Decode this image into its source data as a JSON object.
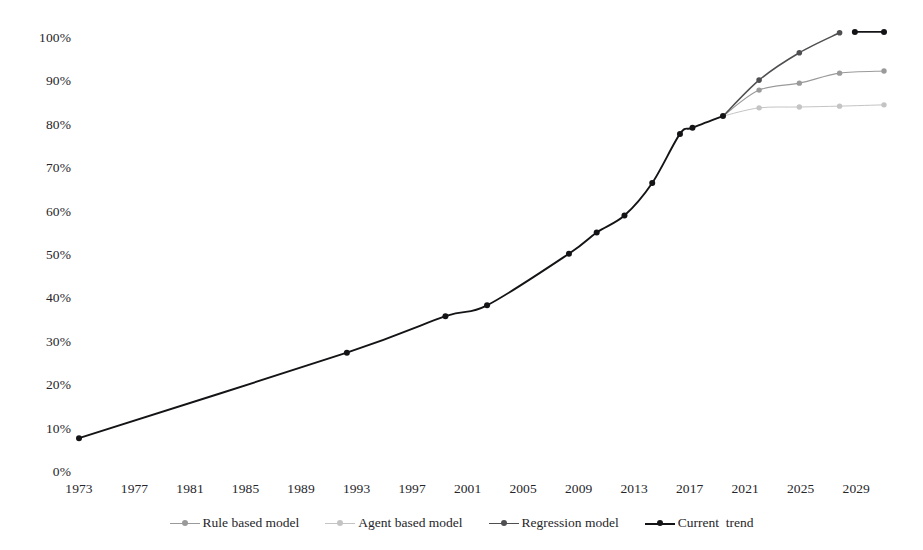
{
  "chart_data": {
    "type": "line",
    "title": "",
    "xlabel": "",
    "ylabel": "",
    "grid": false,
    "legend_position": "bottom",
    "xlim": [
      1973,
      2031
    ],
    "ylim": [
      0,
      100
    ],
    "x_ticks": [
      "1973",
      "1977",
      "1981",
      "1985",
      "1989",
      "1993",
      "1997",
      "2001",
      "2005",
      "2009",
      "2013",
      "2017",
      "2021",
      "2025",
      "2029"
    ],
    "x_tick_values": [
      1973,
      1977,
      1981,
      1985,
      1989,
      1993,
      1997,
      2001,
      2005,
      2009,
      2013,
      2017,
      2021,
      2025,
      2029
    ],
    "y_ticks": [
      "0%",
      "10%",
      "20%",
      "30%",
      "40%",
      "50%",
      "60%",
      "70%",
      "80%",
      "90%",
      "100%"
    ],
    "y_tick_values": [
      0,
      10,
      20,
      30,
      40,
      50,
      60,
      70,
      80,
      90,
      100
    ],
    "series": [
      {
        "name": "Rule based model",
        "color": "#9a9a9a",
        "marker": "circle",
        "points": [
          [
            2019.4,
            82.0
          ],
          [
            2022.0,
            88.0
          ],
          [
            2024.9,
            89.6
          ],
          [
            2027.8,
            91.9
          ],
          [
            2031.0,
            92.4
          ]
        ]
      },
      {
        "name": "Agent based model",
        "color": "#c4c4c4",
        "marker": "circle",
        "points": [
          [
            2019.4,
            82.0
          ],
          [
            2022.0,
            83.9
          ],
          [
            2024.9,
            84.1
          ],
          [
            2027.8,
            84.3
          ],
          [
            2031.0,
            84.6
          ]
        ]
      },
      {
        "name": "Regression model",
        "color": "#4f4f52",
        "marker": "circle",
        "points": [
          [
            2019.4,
            82.0
          ],
          [
            2022.0,
            90.3
          ],
          [
            2024.9,
            96.6
          ],
          [
            2027.8,
            101.2
          ]
        ]
      },
      {
        "name": "Current  trend",
        "color": "#141417",
        "marker": "circle",
        "points": [
          [
            1973.0,
            7.8
          ],
          [
            1992.3,
            27.5
          ],
          [
            1999.4,
            35.9
          ],
          [
            2002.4,
            38.4
          ],
          [
            2008.3,
            50.3
          ],
          [
            2010.3,
            55.2
          ],
          [
            2012.3,
            59.1
          ],
          [
            2014.3,
            66.6
          ],
          [
            2016.3,
            77.9
          ],
          [
            2017.2,
            79.3
          ],
          [
            2019.4,
            82.0
          ]
        ]
      },
      {
        "name": "Current  trend (extension)",
        "color": "#141417",
        "marker": "circle",
        "hide_from_legend": true,
        "points": [
          [
            2028.9,
            101.4
          ],
          [
            2031.0,
            101.4
          ]
        ]
      }
    ],
    "legend": [
      {
        "label": "Rule based model",
        "color": "#9a9a9a"
      },
      {
        "label": "Agent based model",
        "color": "#c4c4c4"
      },
      {
        "label": "Regression model",
        "color": "#4f4f52"
      },
      {
        "label": "Current  trend",
        "color": "#141417"
      }
    ]
  },
  "geometry": {
    "x_at_1973": 79,
    "x_at_2031": 884,
    "y_at_0": 472,
    "y_at_100": 38
  }
}
